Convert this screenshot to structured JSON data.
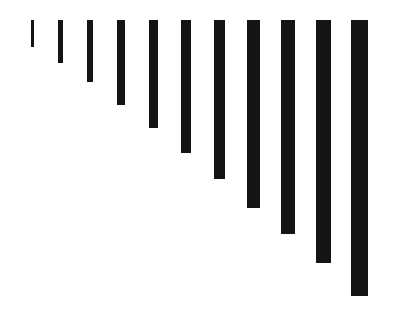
{
  "chart": {
    "background_color": "#ffffff",
    "bar_color": "#141414",
    "title": "",
    "subtitle": ""
  },
  "chart_data": {
    "type": "bar",
    "title": "",
    "subtitle": "",
    "xlabel": "",
    "ylabel": "",
    "orientation": "vertical-hanging",
    "baseline": "top",
    "grid": false,
    "legend": null,
    "legend_position": "none",
    "axis_visible": false,
    "tick_labels_visible": false,
    "categories": [
      "1",
      "2",
      "3",
      "4",
      "5",
      "6",
      "7",
      "8",
      "9",
      "10",
      "11"
    ],
    "values": [
      27,
      43,
      62,
      85,
      108,
      133,
      159,
      188,
      214,
      243,
      276
    ],
    "ylim": [
      0,
      294
    ],
    "bar_widths_px": [
      3,
      5,
      6,
      8,
      9,
      10,
      11,
      13,
      14,
      15,
      17
    ],
    "bar_left_px": [
      31,
      58,
      87,
      117,
      149,
      181,
      214,
      247,
      281,
      316,
      351
    ],
    "bar_top_px": 20,
    "bar_length_px": [
      27,
      43,
      62,
      85,
      108,
      133,
      159,
      188,
      214,
      243,
      276
    ],
    "bars": [
      {
        "label": "1",
        "left": 31,
        "top": 20,
        "width": 3,
        "length": 27
      },
      {
        "label": "2",
        "left": 58,
        "top": 20,
        "width": 5,
        "length": 43
      },
      {
        "label": "3",
        "left": 87,
        "top": 20,
        "width": 6,
        "length": 62
      },
      {
        "label": "4",
        "left": 117,
        "top": 20,
        "width": 8,
        "length": 85
      },
      {
        "label": "5",
        "left": 149,
        "top": 20,
        "width": 9,
        "length": 108
      },
      {
        "label": "6",
        "left": 181,
        "top": 20,
        "width": 10,
        "length": 133
      },
      {
        "label": "7",
        "left": 214,
        "top": 20,
        "width": 11,
        "length": 159
      },
      {
        "label": "8",
        "left": 247,
        "top": 20,
        "width": 13,
        "length": 188
      },
      {
        "label": "9",
        "left": 281,
        "top": 20,
        "width": 14,
        "length": 214
      },
      {
        "label": "10",
        "left": 316,
        "top": 20,
        "width": 15,
        "length": 243
      },
      {
        "label": "11",
        "left": 351,
        "top": 20,
        "width": 17,
        "length": 276
      }
    ]
  }
}
